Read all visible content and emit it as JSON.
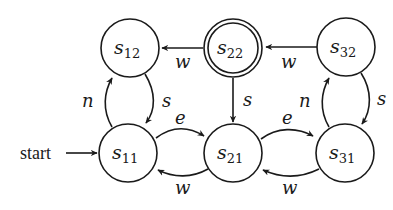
{
  "diagram": {
    "type": "state-machine",
    "start_label": "start",
    "start_state": "s11",
    "accepting_states": [
      "s22"
    ],
    "states": [
      {
        "id": "s12",
        "base": "s",
        "sub": "12",
        "cx": 130,
        "cy": 48,
        "accepting": false
      },
      {
        "id": "s22",
        "base": "s",
        "sub": "22",
        "cx": 233,
        "cy": 48,
        "accepting": true
      },
      {
        "id": "s32",
        "base": "s",
        "sub": "32",
        "cx": 346,
        "cy": 47,
        "accepting": false
      },
      {
        "id": "s11",
        "base": "s",
        "sub": "11",
        "cx": 128,
        "cy": 153,
        "accepting": false
      },
      {
        "id": "s21",
        "base": "s",
        "sub": "21",
        "cx": 233,
        "cy": 153,
        "accepting": false
      },
      {
        "id": "s31",
        "base": "s",
        "sub": "31",
        "cx": 345,
        "cy": 153,
        "accepting": false
      }
    ],
    "transitions": [
      {
        "from": "s22",
        "to": "s12",
        "label": "w"
      },
      {
        "from": "s32",
        "to": "s22",
        "label": "w"
      },
      {
        "from": "s22",
        "to": "s21",
        "label": "s"
      },
      {
        "from": "s11",
        "to": "s12",
        "label": "n"
      },
      {
        "from": "s12",
        "to": "s11",
        "label": "s"
      },
      {
        "from": "s31",
        "to": "s32",
        "label": "n"
      },
      {
        "from": "s32",
        "to": "s31",
        "label": "s"
      },
      {
        "from": "s11",
        "to": "s21",
        "label": "e"
      },
      {
        "from": "s21",
        "to": "s11",
        "label": "w"
      },
      {
        "from": "s21",
        "to": "s31",
        "label": "e"
      },
      {
        "from": "s31",
        "to": "s21",
        "label": "w"
      }
    ]
  }
}
